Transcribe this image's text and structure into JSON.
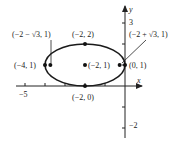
{
  "diagram": {
    "type": "ellipse-graph",
    "equation_center": [
      -2,
      1
    ],
    "semi_axes": {
      "horizontal": 2,
      "vertical": 1
    },
    "axes": {
      "x_label": "x",
      "y_label": "y",
      "x_ticks": [
        -5,
        -4,
        -3,
        -2,
        -1
      ],
      "y_ticks": [
        3,
        2,
        1,
        -1,
        -2
      ],
      "x_tick_labels": [
        {
          "value": -5,
          "text": "−5"
        }
      ],
      "y_tick_labels": [
        {
          "value": 3,
          "text": "3"
        },
        {
          "value": -2,
          "text": "−2"
        }
      ]
    },
    "points": [
      {
        "name": "vertex-left",
        "x": -4,
        "y": 1,
        "label": "(−4, 1)"
      },
      {
        "name": "focus-left",
        "x": -3.732,
        "y": 1,
        "label": "(−2 − √3, 1)"
      },
      {
        "name": "covertex-top",
        "x": -2,
        "y": 2,
        "label": "(−2, 2)"
      },
      {
        "name": "center",
        "x": -2,
        "y": 1,
        "label": "(−2, 1)"
      },
      {
        "name": "covertex-bottom",
        "x": -2,
        "y": 0,
        "label": "(−2, 0)"
      },
      {
        "name": "focus-right",
        "x": -0.268,
        "y": 1,
        "label": "(−2 + √3, 1)"
      },
      {
        "name": "vertex-right",
        "x": 0,
        "y": 1,
        "label": "(0, 1)"
      }
    ]
  }
}
